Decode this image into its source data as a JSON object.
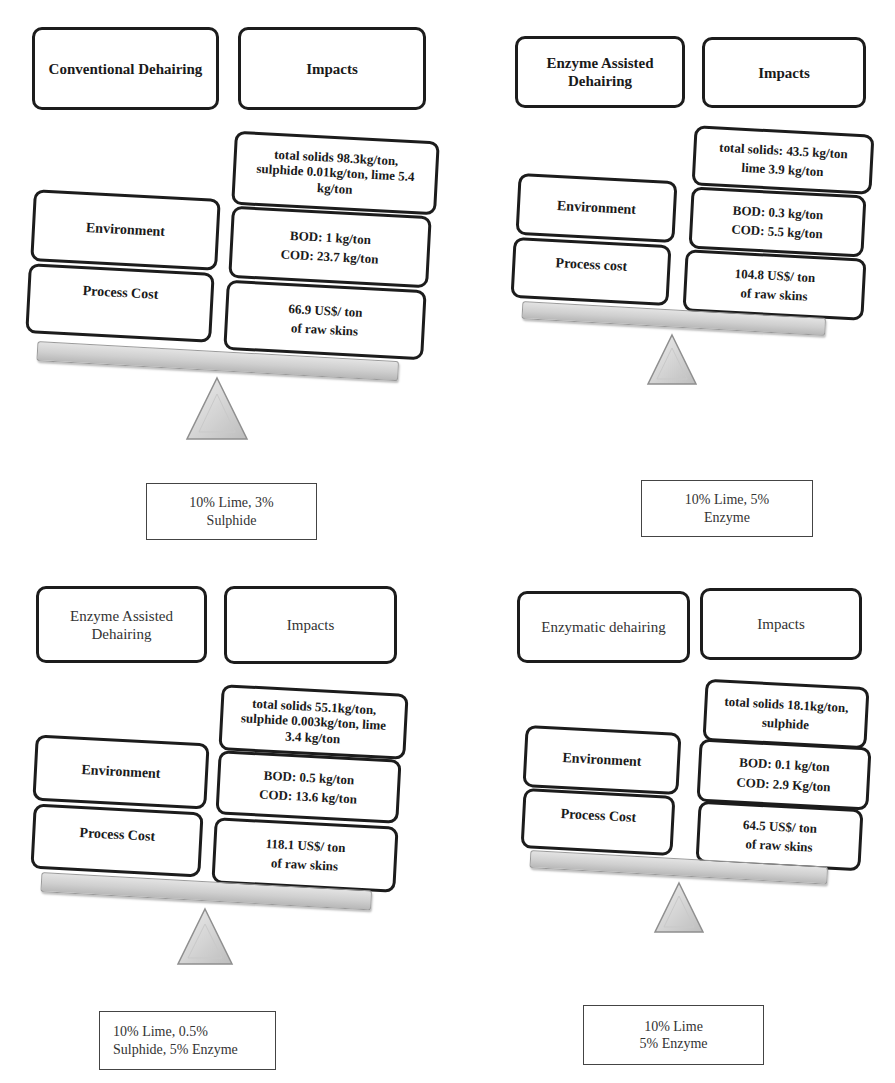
{
  "figure": {
    "panels": [
      {
        "id": "conventional",
        "header_left": "Conventional Dehairing",
        "header_right": "Impacts",
        "header_style": "bold",
        "rows": [
          {
            "label": "",
            "impact_lines": [
              "total solids 98.3kg/ton,",
              "sulphide 0.01kg/ton, lime 5.4",
              "kg/ton"
            ]
          },
          {
            "label": "Environment",
            "impact_lines": [
              "BOD: 1 kg/ton",
              "COD: 23.7 kg/ton"
            ]
          },
          {
            "label": "Process Cost",
            "impact_lines": [
              "66.9 US$/ ton",
              "of raw skins"
            ]
          }
        ],
        "recipe_lines": [
          "10% Lime, 3%",
          "Sulphide"
        ]
      },
      {
        "id": "enzyme-assisted-1",
        "header_left": "Enzyme Assisted Dehairing",
        "header_right": "Impacts",
        "header_style": "bold",
        "rows": [
          {
            "label": "",
            "impact_lines": [
              "total solids: 43.5 kg/ton",
              "lime 3.9 kg/ton"
            ]
          },
          {
            "label": "Environment",
            "impact_lines": [
              "BOD: 0.3 kg/ton",
              "COD:  5.5 kg/ton"
            ]
          },
          {
            "label": "Process cost",
            "impact_lines": [
              "104.8 US$/ ton",
              "of raw skins"
            ]
          }
        ],
        "recipe_lines": [
          "10% Lime, 5%",
          "Enzyme"
        ]
      },
      {
        "id": "enzyme-assisted-2",
        "header_left": "Enzyme Assisted Dehairing",
        "header_right": "Impacts",
        "header_style": "plain",
        "rows": [
          {
            "label": "",
            "impact_lines": [
              "total solids 55.1kg/ton,",
              "sulphide 0.003kg/ton, lime",
              "3.4 kg/ton"
            ]
          },
          {
            "label": "Environment",
            "impact_lines": [
              "BOD: 0.5 kg/ton",
              "COD: 13.6 kg/ton"
            ]
          },
          {
            "label": "Process Cost",
            "impact_lines": [
              "118.1 US$/ ton",
              "of raw skins"
            ]
          }
        ],
        "recipe_lines": [
          "10% Lime, 0.5%",
          "Sulphide, 5% Enzyme"
        ]
      },
      {
        "id": "enzymatic",
        "header_left": "Enzymatic dehairing",
        "header_right": "Impacts",
        "header_style": "plain",
        "rows": [
          {
            "label": "",
            "impact_lines": [
              "total solids 18.1kg/ton,",
              "sulphide"
            ]
          },
          {
            "label": "Environment",
            "impact_lines": [
              "BOD: 0.1 kg/ton",
              "COD: 2.9  Kg/ton"
            ]
          },
          {
            "label": "Process Cost",
            "impact_lines": [
              "64.5 US$/ ton",
              "of raw skins"
            ]
          }
        ],
        "recipe_lines": [
          "10% Lime",
          "5% Enzyme"
        ]
      }
    ],
    "colors": {
      "box_border": "#1c1c1c",
      "beam_fill": "#cfcfcf",
      "fulcrum_fill": "#d6d6d6",
      "text": "#1a1a1a"
    }
  }
}
